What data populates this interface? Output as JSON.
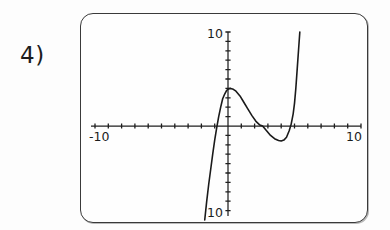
{
  "page": {
    "problem_label": "4)",
    "background_color": "#fdfdfd",
    "ink_color": "#1a1a1a"
  },
  "calculator": {
    "frame_color": "#3a3a3a",
    "screen_color": "#fefefe",
    "labels": {
      "y_max": "10",
      "y_min": "10",
      "x_min": "-10",
      "x_max": "10"
    }
  },
  "chart_data": {
    "type": "line",
    "title": "",
    "subtitle": "",
    "xlabel": "",
    "ylabel": "",
    "xlim": [
      -10,
      10
    ],
    "ylim": [
      -10,
      10
    ],
    "xtick_labels": [
      "-10",
      "10"
    ],
    "ytick_labels": [
      "10",
      "10"
    ],
    "tick_interval": 1,
    "grid": false,
    "legend": null,
    "annotations": [],
    "series": [
      {
        "name": "cubic",
        "description": "cubic polynomial with local maximum near (0.2, 4) and local minimum near (4.0, -1.6); rises steeply off the top of the window to the right and falls off the bottom of the window to the left",
        "features": {
          "local_max": [
            0.2,
            4.0
          ],
          "local_min": [
            4.0,
            -1.6
          ],
          "x_intercepts": [
            -1.0,
            2.6,
            4.7
          ],
          "y_intercept": 3.9,
          "enters_bottom_at_x": -1.7,
          "exits_top_at_x": 5.2
        },
        "points": [
          [
            -1.75,
            -10.0
          ],
          [
            -1.6,
            -8.0
          ],
          [
            -1.45,
            -6.2
          ],
          [
            -1.3,
            -4.6
          ],
          [
            -1.15,
            -3.0
          ],
          [
            -1.0,
            -1.5
          ],
          [
            -0.85,
            -0.2
          ],
          [
            -0.7,
            1.0
          ],
          [
            -0.55,
            2.0
          ],
          [
            -0.4,
            2.9
          ],
          [
            -0.25,
            3.4
          ],
          [
            -0.1,
            3.8
          ],
          [
            0.05,
            3.95
          ],
          [
            0.2,
            4.0
          ],
          [
            0.4,
            3.9
          ],
          [
            0.6,
            3.7
          ],
          [
            0.9,
            3.2
          ],
          [
            1.2,
            2.5
          ],
          [
            1.5,
            1.8
          ],
          [
            1.8,
            1.1
          ],
          [
            2.1,
            0.5
          ],
          [
            2.4,
            0.1
          ],
          [
            2.6,
            0.0
          ],
          [
            2.9,
            -0.5
          ],
          [
            3.2,
            -1.0
          ],
          [
            3.5,
            -1.35
          ],
          [
            3.8,
            -1.55
          ],
          [
            4.0,
            -1.6
          ],
          [
            4.2,
            -1.5
          ],
          [
            4.4,
            -1.2
          ],
          [
            4.6,
            -0.5
          ],
          [
            4.75,
            0.2
          ],
          [
            4.9,
            1.3
          ],
          [
            5.0,
            2.4
          ],
          [
            5.1,
            4.0
          ],
          [
            5.2,
            6.0
          ],
          [
            5.3,
            8.0
          ],
          [
            5.4,
            10.0
          ]
        ]
      }
    ]
  }
}
